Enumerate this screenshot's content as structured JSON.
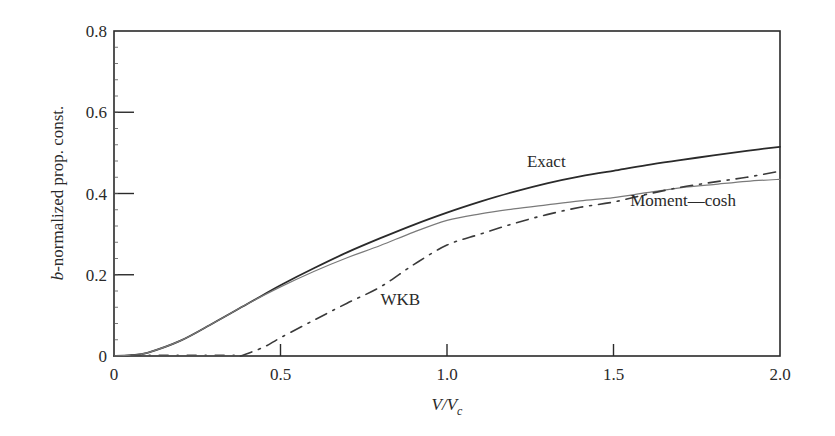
{
  "chart_data": {
    "type": "line",
    "title": "",
    "xlabel": "V/V_c",
    "xlabel_parts": {
      "main": "V/V",
      "sub": "c"
    },
    "ylabel": "b-normalized prop. const.",
    "ylabel_parts": {
      "italic": "b",
      "rest": "-normalized prop. const."
    },
    "xlim": [
      0,
      2.0
    ],
    "ylim": [
      0,
      0.8
    ],
    "xticks": [
      0,
      0.5,
      1.0,
      1.5,
      2.0
    ],
    "xtick_labels": [
      "0",
      "0.5",
      "1.0",
      "1.5",
      "2.0"
    ],
    "yticks": [
      0,
      0.2,
      0.4,
      0.6,
      0.8
    ],
    "ytick_labels": [
      "0",
      "0.2",
      "0.4",
      "0.6",
      "0.8"
    ],
    "grid": false,
    "legend": "inline annotations",
    "series": [
      {
        "name": "Exact",
        "style": "solid",
        "color": "#2a2a2a",
        "width": 1.8,
        "x": [
          0,
          0.05,
          0.1,
          0.2,
          0.3,
          0.4,
          0.5,
          0.6,
          0.7,
          0.8,
          0.9,
          1.0,
          1.1,
          1.2,
          1.3,
          1.4,
          1.5,
          1.6,
          1.7,
          1.8,
          1.9,
          2.0
        ],
        "values": [
          0,
          0.002,
          0.008,
          0.038,
          0.082,
          0.128,
          0.174,
          0.216,
          0.255,
          0.29,
          0.323,
          0.353,
          0.38,
          0.404,
          0.425,
          0.442,
          0.456,
          0.47,
          0.482,
          0.494,
          0.505,
          0.515
        ]
      },
      {
        "name": "Moment—cosh",
        "style": "solid-thin",
        "color": "#7a7a7a",
        "width": 1.2,
        "x": [
          0,
          0.05,
          0.1,
          0.2,
          0.3,
          0.4,
          0.5,
          0.6,
          0.7,
          0.8,
          0.9,
          1.0,
          1.1,
          1.2,
          1.3,
          1.4,
          1.5,
          1.6,
          1.7,
          1.8,
          1.9,
          2.0
        ],
        "values": [
          0,
          0.002,
          0.008,
          0.038,
          0.082,
          0.128,
          0.17,
          0.208,
          0.242,
          0.272,
          0.305,
          0.334,
          0.35,
          0.362,
          0.372,
          0.382,
          0.39,
          0.402,
          0.414,
          0.422,
          0.43,
          0.435
        ]
      },
      {
        "name": "WKB",
        "style": "dash-dot",
        "color": "#3a3a3a",
        "width": 1.6,
        "x": [
          0.38,
          0.45,
          0.5,
          0.6,
          0.7,
          0.8,
          0.9,
          1.0,
          1.1,
          1.2,
          1.3,
          1.4,
          1.5,
          1.6,
          1.7,
          1.8,
          1.9,
          2.0
        ],
        "values": [
          0,
          0.022,
          0.045,
          0.088,
          0.13,
          0.17,
          0.225,
          0.273,
          0.3,
          0.326,
          0.348,
          0.366,
          0.379,
          0.398,
          0.415,
          0.428,
          0.44,
          0.455
        ]
      }
    ],
    "annotations": [
      {
        "text": "Exact",
        "x": 1.24,
        "y": 0.465
      },
      {
        "text": "Moment—cosh",
        "x": 1.55,
        "y": 0.37
      },
      {
        "text": "WKB",
        "x": 0.8,
        "y": 0.125
      }
    ]
  }
}
